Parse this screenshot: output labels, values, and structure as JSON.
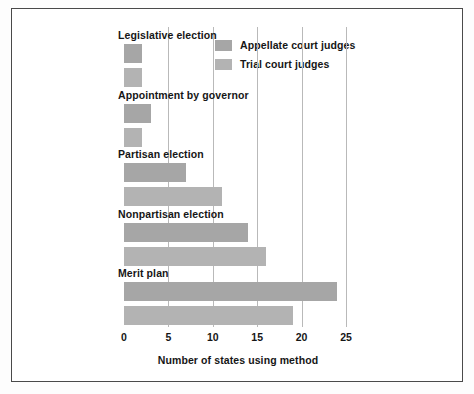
{
  "figure": {
    "background_color": "#ffffff",
    "frame_color": "#4a4a4a"
  },
  "legend": {
    "position": "inside-top-right",
    "entries": [
      {
        "label": "Appellate court judges",
        "color": "#a6a6a6"
      },
      {
        "label": "Trial court judges",
        "color": "#b3b3b3"
      }
    ]
  },
  "axis": {
    "x_title": "Number of states using method",
    "ticks": [
      "0",
      "5",
      "10",
      "15",
      "20",
      "25"
    ]
  },
  "chart_data": {
    "type": "bar",
    "orientation": "horizontal",
    "title": "",
    "subtitle": "",
    "xlabel": "Number of states using method",
    "ylabel": "",
    "xlim": [
      0,
      25
    ],
    "xticks": [
      0,
      5,
      10,
      15,
      20,
      25
    ],
    "grid": true,
    "grid_axis": "x",
    "legend_position": "inside-top-right",
    "categories": [
      "Legislative election",
      "Appointment by governor",
      "Partisan election",
      "Nonpartisan election",
      "Merit plan"
    ],
    "series": [
      {
        "name": "Appellate court judges",
        "color": "#a6a6a6",
        "values": [
          2,
          3,
          7,
          14,
          24
        ]
      },
      {
        "name": "Trial court judges",
        "color": "#b3b3b3",
        "values": [
          2,
          2,
          11,
          16,
          19
        ]
      }
    ]
  }
}
